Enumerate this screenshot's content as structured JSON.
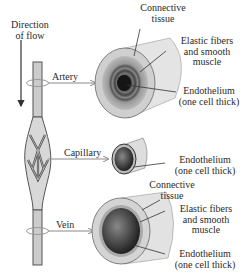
{
  "diagram": {
    "flow_label": {
      "line1": "Direction",
      "line2": "of flow"
    },
    "vessels": [
      {
        "name": "Artery",
        "labels": {
          "connective": {
            "line1": "Connective",
            "line2": "tissue"
          },
          "elastic": {
            "line1": "Elastic fibers",
            "line2": "and smooth",
            "line3": "muscle"
          },
          "endothelium": {
            "line1": "Endothelium",
            "line2": "(one cell thick)"
          }
        }
      },
      {
        "name": "Capillary",
        "labels": {
          "endothelium": {
            "line1": "Endothelium",
            "line2": "(one cell thick)"
          }
        }
      },
      {
        "name": "Vein",
        "labels": {
          "connective": {
            "line1": "Connective",
            "line2": "tissue"
          },
          "elastic": {
            "line1": "Elastic fibers",
            "line2": "and smooth",
            "line3": "muscle"
          },
          "endothelium": {
            "line1": "Endothelium",
            "line2": "(one cell thick)"
          }
        }
      }
    ],
    "colors": {
      "ink": "#2a2a2a",
      "arrow": "#8a8a8a",
      "vessel_fill": "#d9d9d9",
      "vessel_shade": "#9a9a9a",
      "lumen": "#3a3a3a"
    }
  }
}
